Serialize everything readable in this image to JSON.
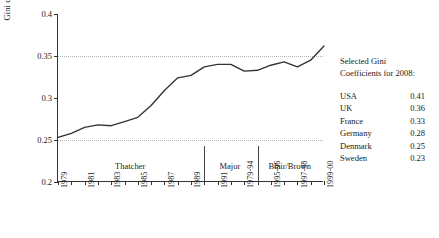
{
  "chart_data": {
    "type": "line",
    "title": "",
    "xlabel": "",
    "ylabel": "Gini coefficient",
    "ylim": [
      0.2,
      0.4
    ],
    "yticks": [
      0.2,
      0.25,
      0.3,
      0.35,
      0.4
    ],
    "ytick_labels": [
      "0.2",
      "0.25",
      "0.3",
      "0.35",
      "0.4"
    ],
    "gridlines_y": [
      0.25,
      0.35
    ],
    "grid": "dotted-horizontal-at-0.25-and-0.35",
    "legend": "none",
    "line_color": "#333333",
    "x": [
      "1979",
      "1980",
      "1981",
      "1982",
      "1983",
      "1984",
      "1985",
      "1986",
      "1987",
      "1988",
      "1989",
      "1990",
      "1991",
      "1993-94",
      "1995-96",
      "1997-98",
      "1999-00",
      "2001-02",
      "2003-04",
      "2005-06",
      "2007-08"
    ],
    "xtick_labels": [
      "1979",
      "1981",
      "1983",
      "1985",
      "1987",
      "1989",
      "1991",
      "1979-94",
      "1995-96",
      "1997-98",
      "1999-00",
      "2001-02",
      "2003-04",
      "2005-06",
      "2007-08"
    ],
    "values": [
      0.253,
      0.258,
      0.265,
      0.268,
      0.267,
      0.272,
      0.277,
      0.291,
      0.309,
      0.324,
      0.327,
      0.337,
      0.34,
      0.34,
      0.332,
      0.333,
      0.339,
      0.343,
      0.337,
      0.345,
      0.362
    ],
    "eras": [
      {
        "label": "Thatcher",
        "start": "1979",
        "end": "1990"
      },
      {
        "label": "Major",
        "start": "1990",
        "end": "1997"
      },
      {
        "label": "Blair/Brown",
        "start": "1997",
        "end": "2007-08"
      }
    ]
  },
  "side_panel": {
    "title_line1": "Selected Gini",
    "title_line2": "Coefficients for 2008:",
    "rows": [
      {
        "country": "USA",
        "value": "0.41"
      },
      {
        "country": "UK",
        "value": "0.36"
      },
      {
        "country": "France",
        "value": "0.33"
      },
      {
        "country": "Germany",
        "value": "0.28"
      },
      {
        "country": "Denmark",
        "value": "0.25"
      },
      {
        "country": "Sweden",
        "value": "0.23"
      }
    ]
  }
}
